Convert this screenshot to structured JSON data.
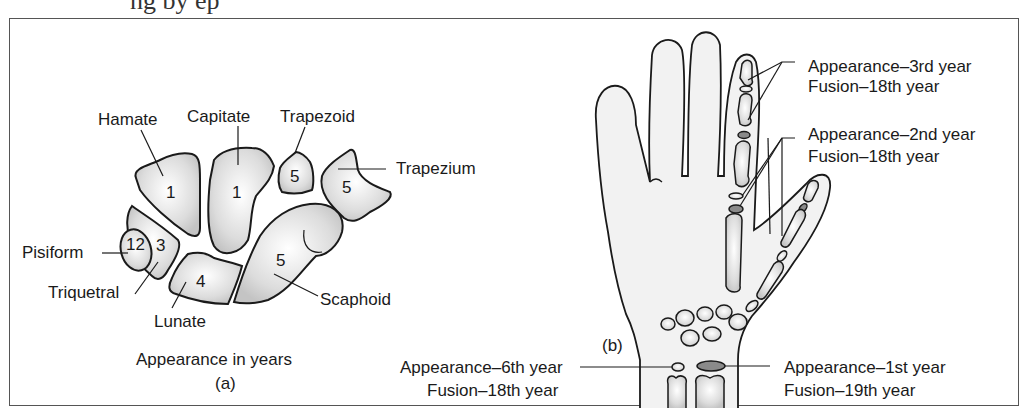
{
  "top_caption_partial": "ng by ep",
  "panel_a": {
    "bones": [
      {
        "name": "Hamate",
        "appearance_year": "1"
      },
      {
        "name": "Capitate",
        "appearance_year": "1"
      },
      {
        "name": "Trapezoid",
        "appearance_year": "5"
      },
      {
        "name": "Trapezium",
        "appearance_year": "5"
      },
      {
        "name": "Pisiform",
        "appearance_year": "12"
      },
      {
        "name": "Triquetral",
        "appearance_year": "3"
      },
      {
        "name": "Lunate",
        "appearance_year": "4"
      },
      {
        "name": "Scaphoid",
        "appearance_year": "5"
      }
    ],
    "caption": "Appearance in years",
    "label": "(a)"
  },
  "panel_b": {
    "label": "(b)",
    "annotations": [
      {
        "appearance": "Appearance–3rd year",
        "fusion": "Fusion–18th year"
      },
      {
        "appearance": "Appearance–2nd year",
        "fusion": "Fusion–18th year"
      },
      {
        "appearance": "Appearance–6th year",
        "fusion": "Fusion–18th year"
      },
      {
        "appearance": "Appearance–1st year",
        "fusion": "Fusion–19th year"
      }
    ]
  }
}
